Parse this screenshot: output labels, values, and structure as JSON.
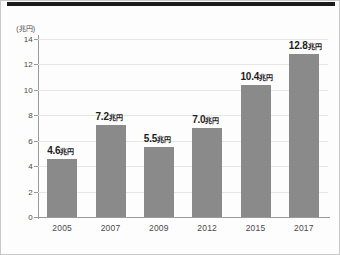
{
  "chart_data": {
    "type": "bar",
    "title": "",
    "subtitle": "",
    "xlabel": "",
    "ylabel": "",
    "yunit": "(兆円)",
    "categories": [
      "2005",
      "2007",
      "2009",
      "2012",
      "2015",
      "2017"
    ],
    "values": [
      4.6,
      7.2,
      5.5,
      7.0,
      10.4,
      12.8
    ],
    "value_labels": [
      "4.6兆円",
      "7.2兆円",
      "5.5兆円",
      "7.0兆円",
      "10.4兆円",
      "12.8兆円"
    ],
    "value_numbers": [
      "4.6",
      "7.2",
      "5.5",
      "7.0",
      "10.4",
      "12.8"
    ],
    "value_units": [
      "兆円",
      "兆円",
      "兆円",
      "兆円",
      "兆円",
      "兆円"
    ],
    "ylim": [
      0,
      14
    ],
    "yticks": [
      0,
      2,
      4,
      6,
      8,
      10,
      12,
      14
    ],
    "ytick_labels": [
      "0",
      "2",
      "4",
      "6",
      "8",
      "10",
      "12",
      "14"
    ],
    "grid": true,
    "legend": "none",
    "bar_color": "#8a8a8a",
    "grid_color": "#e6e6e6",
    "axis_color": "#9a9a9a",
    "label_color": "#1e1e1e",
    "background_color": "#fdfdfd",
    "rule_color": "#1b1b1b"
  }
}
